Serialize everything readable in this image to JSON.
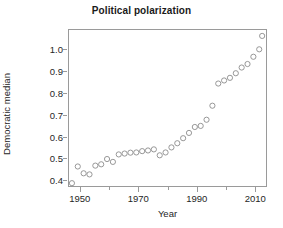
{
  "chart_data": {
    "type": "scatter",
    "title": "Political polarization",
    "xlabel": "Year",
    "ylabel": "Republican median −\nDemocratic median",
    "ylabel_line1": "Republican median −",
    "ylabel_line2": "Democratic median",
    "xlim": [
      1946,
      2014
    ],
    "ylim": [
      0.37,
      1.09
    ],
    "grid": false,
    "legend": null,
    "marker": "open-circle",
    "marker_color": "#8c8c8c",
    "xticks": [
      1950,
      1970,
      1990,
      2010
    ],
    "xticks_minor": [
      1960,
      1980,
      2000
    ],
    "yticks": [
      0.4,
      0.5,
      0.6,
      0.7,
      0.8,
      0.9,
      1.0
    ],
    "ytick_labels": [
      "0.4",
      "0.5",
      "0.6",
      "0.7",
      "0.8",
      "0.9",
      "1.0"
    ],
    "xtick_labels": [
      "1950",
      "1970",
      "1990",
      "2010"
    ],
    "x": [
      1947,
      1949,
      1951,
      1953,
      1955,
      1957,
      1959,
      1961,
      1963,
      1965,
      1967,
      1969,
      1971,
      1973,
      1975,
      1977,
      1979,
      1981,
      1983,
      1985,
      1987,
      1989,
      1991,
      1993,
      1995,
      1997,
      1999,
      2001,
      2003,
      2005,
      2007,
      2009,
      2011
    ],
    "y": [
      0.392,
      0.468,
      0.437,
      0.432,
      0.472,
      0.478,
      0.502,
      0.489,
      0.523,
      0.527,
      0.531,
      0.532,
      0.538,
      0.541,
      0.546,
      0.519,
      0.532,
      0.555,
      0.574,
      0.597,
      0.621,
      0.648,
      0.653,
      0.681,
      0.745,
      0.846,
      0.86,
      0.872,
      0.893,
      0.919,
      0.935,
      0.968,
      1.002
    ],
    "extra_points": [
      {
        "x": 2012,
        "y": 1.063
      }
    ]
  },
  "axes": {
    "frame_color": "#9a9a9a"
  }
}
